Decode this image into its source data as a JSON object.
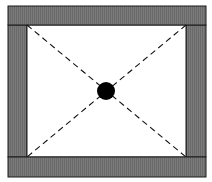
{
  "diagram": {
    "colors": {
      "bar_fill": "#7b7b7b",
      "bar_texture": "#6a6a6a",
      "outline": "#1a1a1a",
      "interior": "#ffffff",
      "diagonal": "#111111",
      "center_dot": "#000000"
    },
    "elements": {
      "top_bar": "shaded bar",
      "bottom_bar": "shaded bar",
      "left_bar": "shaded bar",
      "right_bar": "shaded bar",
      "diagonals": 2,
      "center_marker": "filled circle"
    }
  }
}
